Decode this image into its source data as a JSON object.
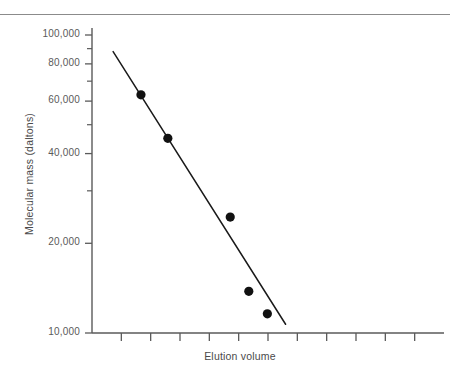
{
  "chart_data": {
    "type": "scatter",
    "title": "",
    "subtitle": "",
    "xlabel": "Elution volume",
    "ylabel": "Molecular mass (daltons)",
    "yscale": "log",
    "xscale": "linear",
    "ylim": [
      10000,
      100000
    ],
    "xlim": [
      0,
      11
    ],
    "grid": false,
    "legend": null,
    "y_tick_labels": [
      "100,000",
      "80,000",
      "60,000",
      "40,000",
      "20,000",
      "10,000"
    ],
    "y_tick_values": [
      100000,
      80000,
      60000,
      40000,
      20000,
      10000
    ],
    "y_minor_tick_values": [
      90000,
      70000,
      50000,
      30000
    ],
    "x_tick_count": 11,
    "x_tick_labels": [
      "",
      "",
      "",
      "",
      "",
      "",
      "",
      "",
      "",
      "",
      ""
    ],
    "series": [
      {
        "name": "Protein standards",
        "marker": "filled-circle",
        "color": "#111111",
        "points": [
          {
            "x": 1.53,
            "y": 63000
          },
          {
            "x": 2.37,
            "y": 45000
          },
          {
            "x": 4.32,
            "y": 24500
          },
          {
            "x": 4.9,
            "y": 13800
          },
          {
            "x": 5.48,
            "y": 11600
          }
        ]
      }
    ],
    "fit_line": {
      "name": "Calibration line",
      "color": "#1a1a1a",
      "start": {
        "x": 0.66,
        "y": 88000
      },
      "end": {
        "x": 6.05,
        "y": 10700
      }
    },
    "axis_color": "#5a5a5a",
    "background_color": "#ffffff"
  },
  "figure": {
    "top_rule_color": "#8b8b8b"
  }
}
